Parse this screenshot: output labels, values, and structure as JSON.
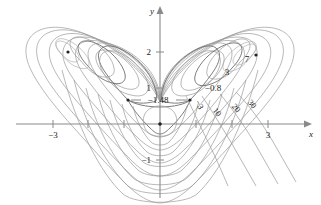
{
  "figure": {
    "type": "contour-plot",
    "axes": {
      "x_axis_label": "x",
      "y_axis_label": "y",
      "x_ticks": [
        {
          "value": -3,
          "label": "−3",
          "px": 53
        },
        {
          "value": -2,
          "label": "",
          "px": 88
        },
        {
          "value": -1,
          "label": "",
          "px": 124
        },
        {
          "value": 0,
          "label": "",
          "px": 160
        },
        {
          "value": 1,
          "label": "",
          "px": 196
        },
        {
          "value": 2,
          "label": "",
          "px": 232
        },
        {
          "value": 3,
          "label": "3",
          "px": 268
        }
      ],
      "y_ticks": [
        {
          "value": 2,
          "label": "2",
          "px": 52
        },
        {
          "value": 1,
          "label": "1",
          "px": 88
        },
        {
          "value": -1,
          "label": "−1",
          "px": 160
        }
      ],
      "origin_px": {
        "x": 160,
        "y": 124
      },
      "unit_px": 36,
      "xlim": [
        -4.0,
        4.2
      ],
      "ylim": [
        -2.2,
        2.9
      ]
    },
    "contour_levels": [
      {
        "label": "−1.48",
        "value": -1.48,
        "role": "saddle-level"
      },
      {
        "label": "−0.8",
        "value": -0.8,
        "role": "level"
      },
      {
        "label": "−3",
        "value": -3,
        "role": "level"
      },
      {
        "label": "3",
        "value": 3,
        "role": "level"
      },
      {
        "label": "7",
        "value": 7,
        "role": "level"
      },
      {
        "label": "10",
        "value": 10,
        "role": "level"
      },
      {
        "label": "20",
        "value": 20,
        "role": "level"
      },
      {
        "label": "30",
        "value": 30,
        "role": "level"
      }
    ],
    "critical_points": [
      {
        "name": "left-minimum",
        "px": {
          "x": 68,
          "y": 52
        },
        "kind": "minimum"
      },
      {
        "name": "right-minimum",
        "px": {
          "x": 256,
          "y": 55
        },
        "kind": "minimum"
      },
      {
        "name": "left-saddle",
        "px": {
          "x": 128,
          "y": 100
        },
        "kind": "saddle"
      },
      {
        "name": "right-saddle",
        "px": {
          "x": 190,
          "y": 100
        },
        "kind": "saddle"
      },
      {
        "name": "origin-point",
        "px": {
          "x": 160,
          "y": 124
        },
        "kind": "local-max"
      }
    ],
    "annotations": [
      {
        "name": "label-neg-1-48",
        "text": "−1.48",
        "x": 158,
        "y": 103,
        "rotate": 0,
        "anchor": "middle"
      },
      {
        "name": "label-neg-0-8",
        "text": "−0.8",
        "x": 213,
        "y": 91,
        "rotate": 0,
        "anchor": "middle"
      },
      {
        "name": "label-neg-3",
        "text": "−3",
        "x": 197,
        "y": 106,
        "rotate": 62,
        "anchor": "middle"
      },
      {
        "name": "label-3",
        "text": "3",
        "x": 227,
        "y": 75,
        "rotate": 0,
        "anchor": "middle"
      },
      {
        "name": "label-7",
        "text": "7",
        "x": 247,
        "y": 62,
        "rotate": 0,
        "anchor": "middle"
      },
      {
        "name": "label-10",
        "text": "10",
        "x": 215,
        "y": 114,
        "rotate": 48,
        "anchor": "middle"
      },
      {
        "name": "label-20",
        "text": "20",
        "x": 234,
        "y": 110,
        "rotate": 48,
        "anchor": "middle"
      },
      {
        "name": "label-30",
        "text": "30",
        "x": 250,
        "y": 106,
        "rotate": 48,
        "anchor": "middle"
      }
    ],
    "colors": {
      "axis": "#8a8a8a",
      "contour": "#9a9a9a",
      "contour_dark": "#6e6e6e",
      "text": "#1a1a1a",
      "background": "#ffffff"
    }
  }
}
